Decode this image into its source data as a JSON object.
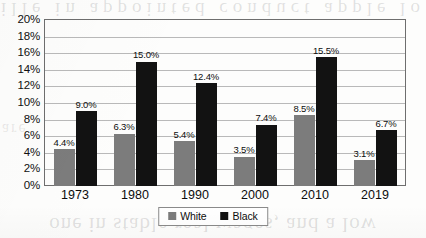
{
  "chart_data": {
    "type": "bar",
    "title": "",
    "xlabel": "",
    "ylabel": "",
    "categories": [
      "1973",
      "1980",
      "1990",
      "2000",
      "2010",
      "2019"
    ],
    "series": [
      {
        "name": "White",
        "color": "#7c7c7c",
        "values": [
          4.4,
          6.3,
          5.4,
          3.5,
          8.5,
          3.1
        ],
        "labels": [
          "4.4%",
          "6.3%",
          "5.4%",
          "3.5%",
          "8.5%",
          "3.1%"
        ]
      },
      {
        "name": "Black",
        "color": "#121212",
        "values": [
          9.0,
          15.0,
          12.4,
          7.4,
          15.5,
          6.7
        ],
        "labels": [
          "9.0%",
          "15.0%",
          "12.4%",
          "7.4%",
          "15.5%",
          "6.7%"
        ]
      }
    ],
    "ylim": [
      0,
      20
    ],
    "ytick_step": 2,
    "ytick_labels": [
      "20%",
      "18%",
      "16%",
      "14%",
      "12%",
      "10%",
      "8%",
      "6%",
      "4%",
      "2%",
      "0%"
    ],
    "grid": true,
    "legend_position": "bottom-center"
  },
  "legend": {
    "entries": [
      {
        "label": "White",
        "swatch": "white-series"
      },
      {
        "label": "Black",
        "swatch": "black-series"
      }
    ]
  },
  "page_artifacts": {
    "ghost_top": "ille in appointed conduct apple lo",
    "ghost_bottom": "one in stable real wages, and a low",
    "ghost_mid_left": "are"
  }
}
